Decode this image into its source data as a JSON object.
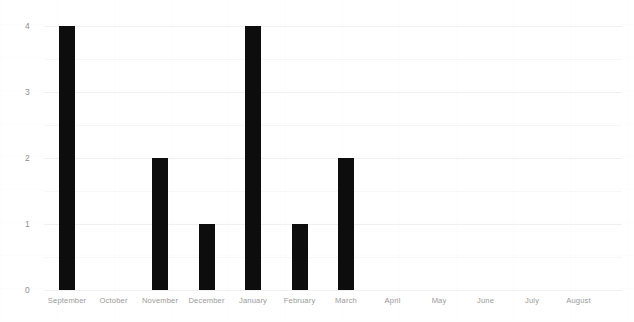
{
  "chart_data": {
    "type": "bar",
    "title": "",
    "subtitle": "",
    "xlabel": "",
    "ylabel": "",
    "categories": [
      "September",
      "October",
      "November",
      "December",
      "January",
      "February",
      "March",
      "April",
      "May",
      "June",
      "July",
      "August"
    ],
    "values": [
      4,
      0,
      2,
      1,
      4,
      1,
      2,
      0,
      0,
      0,
      0,
      0
    ],
    "ylim": [
      0,
      4
    ],
    "ytick_labels": [
      "0",
      "1",
      "2",
      "3",
      "4"
    ],
    "ytick_values": [
      0,
      1,
      2,
      3,
      4
    ],
    "minor_gridline_values": [
      0.5,
      1.5,
      2.5,
      3.5
    ],
    "grid": true,
    "legend": false,
    "legend_position": "none",
    "annotations": [],
    "colors": {
      "bar": "#0d0d0d",
      "background": "#ffffff",
      "gridline_major": "#f0f0f0",
      "gridline_minor": "#f7f7f7",
      "x_tick_label": "#9a9a9a",
      "y_tick_label": "#8f8f8f"
    }
  }
}
